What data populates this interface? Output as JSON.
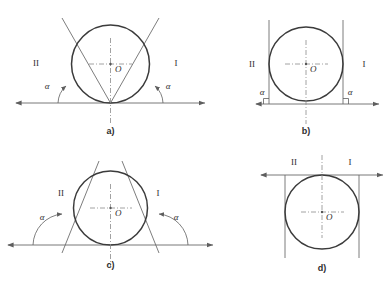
{
  "figure": {
    "background_color": "#ffffff",
    "circle_color": "#3b3b3b",
    "line_color": "#6e6e6e",
    "text_color": "#2e2e2e",
    "panels": [
      {
        "id": "a",
        "label": "a)",
        "description": "Circle resting on horizontal axis; two tangent lines diverge upward-outward from the bottom contact point forming acute angle alpha with the axis on each side.",
        "center": {
          "cx": 110.5,
          "cy": 64.0,
          "r": 39.0
        },
        "center_label": "O",
        "baseline_y": 103.0,
        "baseline_x1": 16.0,
        "baseline_x2": 205.0,
        "left_label": "II",
        "right_label": "I",
        "angle_label": "α",
        "angle_degrees": 62,
        "angle_type": "acute",
        "tangent_style": "diverging-up",
        "has_right_angle_marks": false,
        "axis_tangent_at": "bottom",
        "vertical_lines": false,
        "left_angle_label_pos": {
          "x": 47.0,
          "y": 89.0
        },
        "right_angle_label_pos": {
          "x": 168.0,
          "y": 89.0
        },
        "left_roman_pos": {
          "x": 36.0,
          "y": 66.0
        },
        "right_roman_pos": {
          "x": 176.0,
          "y": 66.0
        },
        "panel_label_pos": {
          "x": 110.5,
          "y": 134.0
        }
      },
      {
        "id": "b",
        "label": "b)",
        "description": "Circle resting on horizontal axis; two vertical tangent lines touch the circle at its left and right extremes, meeting the axis at right angles marked with squares and labelled alpha.",
        "center": {
          "cx": 306.0,
          "cy": 64.0,
          "r": 37.0
        },
        "center_label": "O",
        "baseline_y": 104.0,
        "baseline_x1": 256.0,
        "baseline_x2": 379.0,
        "left_label": "II",
        "right_label": "I",
        "angle_label": "α",
        "angle_degrees": 90,
        "angle_type": "right",
        "tangent_style": "vertical",
        "has_right_angle_marks": true,
        "axis_tangent_at": "bottom",
        "vertical_lines": true,
        "left_angle_label_pos": {
          "x": 262.0,
          "y": 95.0
        },
        "right_angle_label_pos": {
          "x": 349.0,
          "y": 95.0
        },
        "left_roman_pos": {
          "x": 252.0,
          "y": 67.0
        },
        "right_roman_pos": {
          "x": 364.0,
          "y": 67.0
        },
        "panel_label_pos": {
          "x": 306.0,
          "y": 134.0
        }
      },
      {
        "id": "c",
        "label": "c)",
        "description": "Circle resting on horizontal axis; two tangent lines converge upward forming a tent, meeting the axis at an obtuse angle alpha measured on each outer side.",
        "center": {
          "cx": 110.5,
          "cy": 208.0,
          "r": 37.0
        },
        "center_label": "O",
        "baseline_y": 245.0,
        "baseline_x1": 8.0,
        "baseline_x2": 213.0,
        "left_label": "II",
        "right_label": "I",
        "angle_label": "α",
        "angle_degrees": 118,
        "angle_type": "obtuse",
        "tangent_style": "converging-up",
        "has_right_angle_marks": false,
        "axis_tangent_at": "bottom",
        "vertical_lines": false,
        "left_angle_label_pos": {
          "x": 42.0,
          "y": 220.0
        },
        "right_angle_label_pos": {
          "x": 176.0,
          "y": 220.0
        },
        "left_roman_pos": {
          "x": 61.0,
          "y": 196.0
        },
        "right_roman_pos": {
          "x": 158.0,
          "y": 196.0
        },
        "panel_label_pos": {
          "x": 110.5,
          "y": 268.0
        }
      },
      {
        "id": "d",
        "label": "d)",
        "description": "Circle with the horizontal double arrow axis tangent at the top of the circle; region labels II and I sit above the axis and two vertical tangent lines descend from the circle's left and right extremes.",
        "center": {
          "cx": 322.0,
          "cy": 212.0,
          "r": 37.0
        },
        "center_label": "O",
        "baseline_y": 175.0,
        "baseline_x1": 261.0,
        "baseline_x2": 383.0,
        "left_label": "II",
        "right_label": "I",
        "angle_label": "",
        "angle_degrees": 180,
        "angle_type": "straight",
        "tangent_style": "vertical-down",
        "has_right_angle_marks": false,
        "axis_tangent_at": "top",
        "vertical_lines": true,
        "left_angle_label_pos": null,
        "right_angle_label_pos": null,
        "left_roman_pos": {
          "x": 294.0,
          "y": 165.0
        },
        "right_roman_pos": {
          "x": 350.0,
          "y": 165.0
        },
        "panel_label_pos": {
          "x": 322.0,
          "y": 271.0
        }
      }
    ]
  }
}
